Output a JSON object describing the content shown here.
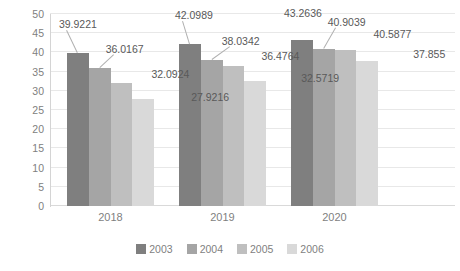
{
  "chart_data": {
    "type": "bar",
    "title": "",
    "subtitle": "",
    "xlabel": "",
    "ylabel": "",
    "categories": [
      "2018",
      "2019",
      "2020"
    ],
    "series": [
      {
        "name": "2003",
        "color": "#7f7f7f",
        "values": [
          39.9221,
          42.0989,
          43.2636
        ]
      },
      {
        "name": "2004",
        "color": "#a5a5a5",
        "values": [
          36.0167,
          38.0342,
          40.9039
        ]
      },
      {
        "name": "2005",
        "color": "#bfbfbf",
        "values": [
          32.0924,
          36.4764,
          40.5877
        ]
      },
      {
        "name": "2006",
        "color": "#d9d9d9",
        "values": [
          27.9216,
          32.5719,
          37.855
        ]
      }
    ],
    "y_ticks": [
      0,
      5,
      10,
      15,
      20,
      25,
      30,
      35,
      40,
      45,
      50
    ],
    "ylim": [
      0,
      50
    ],
    "grid": true,
    "legend_position": "bottom",
    "data_labels": [
      "39.9221",
      "36.0167",
      "32.0924",
      "27.9216",
      "42.0989",
      "38.0342",
      "36.4764",
      "32.5719",
      "43.2636",
      "40.9039",
      "40.5877",
      "37.855"
    ]
  }
}
